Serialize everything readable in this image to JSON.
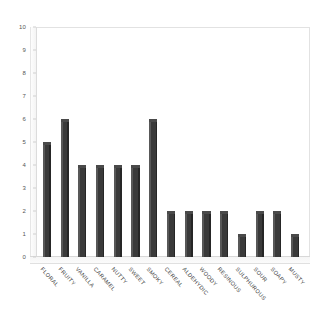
{
  "chart_data": {
    "type": "bar",
    "title": "",
    "subtitle": "",
    "xlabel": "",
    "ylabel": "",
    "ylim": [
      0,
      10
    ],
    "ytick_step": 1,
    "grid": false,
    "legend": false,
    "legend_position": "none",
    "style": "3d-bar",
    "bar_color": "#3a3a3a",
    "bar_side_color": "#585858",
    "bar_top_color": "#4a4a4a",
    "axis_color": "#dcdcdc",
    "background": "#ffffff",
    "categories": [
      "FLORAL",
      "FRUITY",
      "VANILLA",
      "CARAMEL",
      "NUTTY",
      "SWEET",
      "SMOKY",
      "CEREAL",
      "ALDEHYDIC",
      "WOODY",
      "RESINOUS",
      "SULPHUROUS",
      "SOUR",
      "SOAPY",
      "MUSTY"
    ],
    "values": [
      5,
      6,
      4,
      4,
      4,
      4,
      6,
      2,
      2,
      2,
      2,
      1,
      2,
      2,
      1
    ],
    "ytick_labels": [
      "0",
      "1",
      "2",
      "3",
      "4",
      "5",
      "6",
      "7",
      "8",
      "9",
      "10"
    ]
  }
}
